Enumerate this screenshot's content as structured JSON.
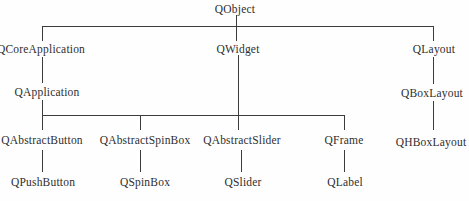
{
  "diagram": {
    "type": "tree",
    "nodes": [
      {
        "id": "qobject",
        "label": "QObject"
      },
      {
        "id": "qcoreapplication",
        "label": "QCoreApplication"
      },
      {
        "id": "qwidget",
        "label": "QWidget"
      },
      {
        "id": "qlayout",
        "label": "QLayout"
      },
      {
        "id": "qapplication",
        "label": "QApplication"
      },
      {
        "id": "qboxlayout",
        "label": "QBoxLayout"
      },
      {
        "id": "qabstractbutton",
        "label": "QAbstractButton"
      },
      {
        "id": "qabstractspinbox",
        "label": "QAbstractSpinBox"
      },
      {
        "id": "qabstractslider",
        "label": "QAbstractSlider"
      },
      {
        "id": "qframe",
        "label": "QFrame"
      },
      {
        "id": "qhboxlayout",
        "label": "QHBoxLayout"
      },
      {
        "id": "qpushbutton",
        "label": "QPushButton"
      },
      {
        "id": "qspinbox",
        "label": "QSpinBox"
      },
      {
        "id": "qslider",
        "label": "QSlider"
      },
      {
        "id": "qlabel",
        "label": "QLabel"
      }
    ],
    "edges": [
      [
        "QObject",
        "QCoreApplication"
      ],
      [
        "QObject",
        "QWidget"
      ],
      [
        "QObject",
        "QLayout"
      ],
      [
        "QCoreApplication",
        "QApplication"
      ],
      [
        "QWidget",
        "QAbstractButton"
      ],
      [
        "QWidget",
        "QAbstractSpinBox"
      ],
      [
        "QWidget",
        "QAbstractSlider"
      ],
      [
        "QWidget",
        "QFrame"
      ],
      [
        "QLayout",
        "QBoxLayout"
      ],
      [
        "QBoxLayout",
        "QHBoxLayout"
      ],
      [
        "QAbstractButton",
        "QPushButton"
      ],
      [
        "QAbstractSpinBox",
        "QSpinBox"
      ],
      [
        "QAbstractSlider",
        "QSlider"
      ],
      [
        "QFrame",
        "QLabel"
      ]
    ],
    "line_color": "#3c3c3c",
    "text_color": "#2e2e2e"
  }
}
